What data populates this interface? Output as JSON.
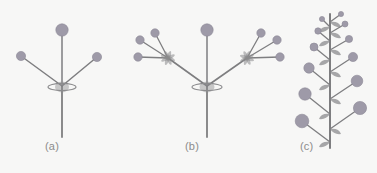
{
  "figure": {
    "background_color": "#f7f7f6",
    "stem_color": "#7e7e80",
    "flower_color": "#9e9aa8",
    "flower_stroke": "#8c8896",
    "bract_color": "#8b8b8d",
    "caption_color": "#8c8c8c"
  },
  "captions": {
    "a": "(a)",
    "b": "(b)",
    "c": "(c)"
  },
  "chart_data": {
    "type": "diagram",
    "title": "",
    "subtitle": "",
    "xlabel": "",
    "ylabel": "",
    "panels": [
      {
        "label": "(a)",
        "name": "simple-umbel",
        "axis": {
          "x": 62,
          "y_top": 86,
          "y_bottom": 137
        },
        "node": {
          "x": 62,
          "y": 86
        },
        "bract": {
          "cx": 62,
          "cy": 87,
          "rx": 14,
          "ry": 3.6
        },
        "pedicels": [
          {
            "x1": 62,
            "y1": 86,
            "x2": 62,
            "y2": 30,
            "head_r": 6.2
          },
          {
            "x1": 62,
            "y1": 86,
            "x2": 21,
            "y2": 56,
            "head_r": 4.6
          },
          {
            "x1": 62,
            "y1": 86,
            "x2": 97,
            "y2": 57,
            "head_r": 4.6
          }
        ]
      },
      {
        "label": "(b)",
        "name": "compound-umbel",
        "axis": {
          "x": 207,
          "y_top": 86,
          "y_bottom": 137
        },
        "node": {
          "x": 207,
          "y": 86
        },
        "bract": {
          "cx": 207,
          "cy": 87,
          "rx": 15,
          "ry": 3.6
        },
        "rays": [
          {
            "x1": 207,
            "y1": 86,
            "x2": 168,
            "y2": 58
          },
          {
            "x1": 207,
            "y1": 86,
            "x2": 247,
            "y2": 58
          }
        ],
        "central_pedicel": {
          "x1": 207,
          "y1": 86,
          "x2": 207,
          "y2": 30,
          "head_r": 6.2
        },
        "secondary_umbels": [
          {
            "node": {
              "x": 168,
              "y": 58
            },
            "bractlets": 4,
            "pedicels": [
              {
                "x2": 140,
                "y2": 40,
                "head_r": 4.2
              },
              {
                "x2": 155,
                "y2": 33,
                "head_r": 4.2
              },
              {
                "x2": 138,
                "y2": 57,
                "head_r": 4.2
              }
            ]
          },
          {
            "node": {
              "x": 247,
              "y": 58
            },
            "bractlets": 4,
            "pedicels": [
              {
                "x2": 261,
                "y2": 33,
                "head_r": 4.2
              },
              {
                "x2": 277,
                "y2": 40,
                "head_r": 4.2
              },
              {
                "x2": 280,
                "y2": 57,
                "head_r": 4.2
              }
            ]
          }
        ]
      },
      {
        "label": "(c)",
        "name": "raceme",
        "axis": {
          "x": 330,
          "y_top": 14,
          "y_bottom": 148
        },
        "flowers": [
          {
            "side": "right",
            "base_y": 22,
            "tip_x": 341,
            "tip_y": 14,
            "head_r": 2.6,
            "bract": true
          },
          {
            "side": "left",
            "base_y": 27,
            "tip_x": 322,
            "tip_y": 19,
            "head_r": 2.6,
            "bract": true
          },
          {
            "side": "right",
            "base_y": 33,
            "tip_x": 345,
            "tip_y": 24,
            "head_r": 3.0,
            "bract": true
          },
          {
            "side": "left",
            "base_y": 41,
            "tip_x": 318,
            "tip_y": 31,
            "head_r": 3.2,
            "bract": true
          },
          {
            "side": "right",
            "base_y": 50,
            "tip_x": 349,
            "tip_y": 39,
            "head_r": 3.6,
            "bract": true
          },
          {
            "side": "left",
            "base_y": 60,
            "tip_x": 314,
            "tip_y": 47,
            "head_r": 4.0,
            "bract": true
          },
          {
            "side": "right",
            "base_y": 72,
            "tip_x": 353,
            "tip_y": 57,
            "head_r": 4.6,
            "bract": true
          },
          {
            "side": "left",
            "base_y": 85,
            "tip_x": 309,
            "tip_y": 68,
            "head_r": 5.2,
            "bract": true
          },
          {
            "side": "right",
            "base_y": 99,
            "tip_x": 357,
            "tip_y": 81,
            "head_r": 5.8,
            "bract": true
          },
          {
            "side": "left",
            "base_y": 114,
            "tip_x": 305,
            "tip_y": 94,
            "head_r": 6.2,
            "bract": true
          },
          {
            "side": "right",
            "base_y": 129,
            "tip_x": 360,
            "tip_y": 108,
            "head_r": 6.6,
            "bract": true
          },
          {
            "side": "left",
            "base_y": 142,
            "tip_x": 302,
            "tip_y": 121,
            "head_r": 6.8,
            "bract": true
          }
        ]
      }
    ]
  }
}
